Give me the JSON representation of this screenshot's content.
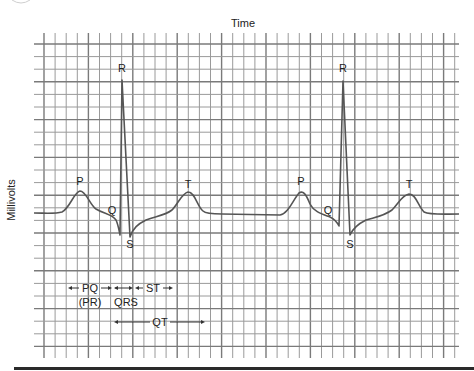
{
  "title": "Time",
  "y_axis_label": "Millivolts",
  "wave_labels": [
    {
      "text": "P",
      "x": 80,
      "y": 185
    },
    {
      "text": "Q",
      "x": 112,
      "y": 214
    },
    {
      "text": "R",
      "x": 122,
      "y": 72
    },
    {
      "text": "S",
      "x": 130,
      "y": 248
    },
    {
      "text": "T",
      "x": 188,
      "y": 188
    },
    {
      "text": "P",
      "x": 301,
      "y": 185
    },
    {
      "text": "Q",
      "x": 328,
      "y": 214
    },
    {
      "text": "R",
      "x": 343,
      "y": 72
    },
    {
      "text": "S",
      "x": 350,
      "y": 248
    },
    {
      "text": "T",
      "x": 409,
      "y": 188
    }
  ],
  "intervals": {
    "pq": "PQ",
    "pr": "(PR)",
    "qrs": "QRS",
    "st": "ST",
    "qt": "QT"
  },
  "colors": {
    "grid": "#9a9a9a",
    "grid_major": "#7a7a7a",
    "trace": "#555555",
    "text": "#222222",
    "bottom_rule": "#2a2a2a"
  },
  "chart_data": {
    "type": "line",
    "title": "Time",
    "xlabel": "Time",
    "ylabel": "Millivolts",
    "grid": true,
    "waves": [
      "P",
      "Q",
      "R",
      "S",
      "T"
    ],
    "beats": 2,
    "intervals": [
      "PQ (PR)",
      "QRS",
      "ST",
      "QT"
    ],
    "key_points_px": [
      {
        "label": "baseline",
        "x": 34,
        "y": 213
      },
      {
        "label": "P",
        "x": 80,
        "y": 192
      },
      {
        "label": "Q",
        "x": 120,
        "y": 234
      },
      {
        "label": "R",
        "x": 122,
        "y": 80
      },
      {
        "label": "S",
        "x": 130,
        "y": 236
      },
      {
        "label": "T",
        "x": 188,
        "y": 193
      },
      {
        "label": "P",
        "x": 301,
        "y": 192
      },
      {
        "label": "Q",
        "x": 339,
        "y": 226
      },
      {
        "label": "R",
        "x": 343,
        "y": 81
      },
      {
        "label": "S",
        "x": 350,
        "y": 234
      },
      {
        "label": "T",
        "x": 409,
        "y": 195
      }
    ]
  }
}
